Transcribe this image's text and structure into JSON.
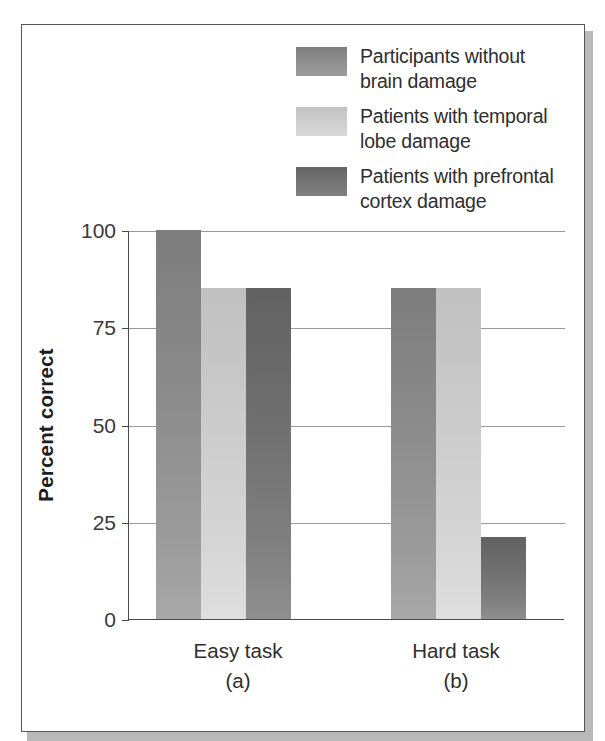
{
  "figure": {
    "background_color": "#ffffff",
    "frame_color": "#555555"
  },
  "legend": {
    "position": "top-right",
    "entries": [
      {
        "label_line1": "Participants without",
        "label_line2": "brain damage",
        "color": "#8d8d8d",
        "swatch_name": "legend-swatch-control"
      },
      {
        "label_line1": "Patients with temporal",
        "label_line2": "lobe damage",
        "color": "#cdcdcd",
        "swatch_name": "legend-swatch-temporal"
      },
      {
        "label_line1": "Patients with prefrontal",
        "label_line2": "cortex damage",
        "color": "#727272",
        "swatch_name": "legend-swatch-prefrontal"
      }
    ]
  },
  "axes": {
    "y_title": "Percent correct",
    "y_ticks": [
      "0",
      "25",
      "50",
      "75",
      "100"
    ],
    "x_groups": [
      {
        "name": "Easy task",
        "sub": "(a)"
      },
      {
        "name": "Hard task",
        "sub": "(b)"
      }
    ]
  },
  "chart_data": {
    "type": "bar",
    "title": "",
    "xlabel": "",
    "ylabel": "Percent correct",
    "ylim": [
      0,
      100
    ],
    "yticks": [
      0,
      25,
      50,
      75,
      100
    ],
    "grid": true,
    "legend_position": "top-right",
    "categories": [
      "Easy task (a)",
      "Hard task (b)"
    ],
    "series": [
      {
        "name": "Participants without brain damage",
        "color": "#8d8d8d",
        "values": [
          100,
          85
        ]
      },
      {
        "name": "Patients with temporal lobe damage",
        "color": "#cdcdcd",
        "values": [
          85,
          85
        ]
      },
      {
        "name": "Patients with prefrontal cortex damage",
        "color": "#727272",
        "values": [
          85,
          21
        ]
      }
    ]
  }
}
